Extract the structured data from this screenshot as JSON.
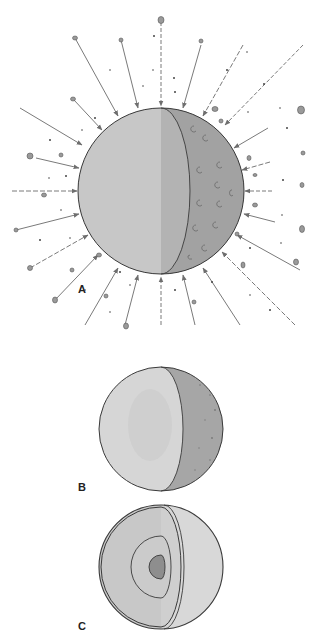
{
  "figure": {
    "panels": [
      {
        "id": "A",
        "label": "A",
        "description": "Accreting planet bombarded by planetesimals; cratered cut-away sphere with inward arrows",
        "cx": 161,
        "cy": 191,
        "r": 83,
        "label_pos": [
          78,
          283
        ]
      },
      {
        "id": "B",
        "label": "B",
        "description": "Heated, partially differentiated sphere",
        "cx": 161,
        "cy": 429,
        "r": 62,
        "label_pos": [
          78,
          481
        ]
      },
      {
        "id": "C",
        "label": "C",
        "description": "Differentiated sphere with core, mantle and crust layers",
        "cx": 161,
        "cy": 567,
        "r": 62,
        "label_pos": [
          78,
          620
        ]
      }
    ],
    "colors": {
      "sphere_face": "#c9c9c9",
      "sphere_side_dark": "#a4a4a4",
      "sphere_light": "#dcdcdc",
      "outline": "#3a3a3a",
      "arrow": "#7a7a7a",
      "core": "#8e8e8e",
      "debris": "#9a9a9a"
    }
  }
}
